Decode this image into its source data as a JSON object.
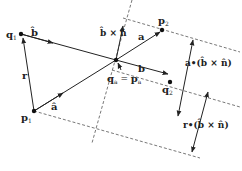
{
  "diagram": {
    "points": {
      "q1": {
        "label": "q",
        "sub": "1"
      },
      "p1": {
        "label": "p",
        "sub": "1"
      },
      "p2": {
        "label": "p",
        "sub": "2"
      },
      "q2": {
        "label": "q",
        "sub": "2"
      },
      "qa_pa": {
        "left": "q",
        "left_sub": "a",
        "eq": " = ",
        "right": "p",
        "right_sub": "a"
      }
    },
    "vectors": {
      "b_hat": "b̂",
      "b": "b",
      "a": "a",
      "a_hat": "â",
      "r": "r",
      "b_cross_n": "b̂ × n̂"
    },
    "measures": {
      "a_dot": "a•(b̂ × n̂)",
      "r_dot": "r•(b̂ × n̂)"
    },
    "colors": {
      "line": "#222222",
      "dashed": "#555555",
      "background": "#ffffff"
    }
  }
}
